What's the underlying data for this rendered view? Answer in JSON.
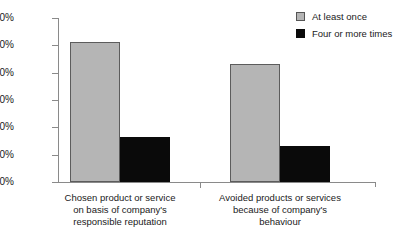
{
  "chart_data": {
    "type": "bar",
    "title": "",
    "xlabel": "",
    "ylabel": "",
    "ylim": [
      0,
      60
    ],
    "grid": false,
    "legend_position": "top-right",
    "categories": [
      "Chosen product or service\non basis of company's\nresponsible reputation",
      "Avoided products or services\nbecause of company's\nbehaviour"
    ],
    "series": [
      {
        "name": "At least once",
        "color": "#b5b5b5",
        "values": [
          51.2,
          43.2
        ]
      },
      {
        "name": "Four or more times",
        "color": "#0a0a0a",
        "values": [
          16.5,
          13.0
        ]
      }
    ],
    "yticks": [
      {
        "value": 60,
        "label": "60%"
      },
      {
        "value": 50,
        "label": "50%"
      },
      {
        "value": 40,
        "label": "40%"
      },
      {
        "value": 30,
        "label": "30%"
      },
      {
        "value": 20,
        "label": "20%"
      },
      {
        "value": 10,
        "label": "10%"
      },
      {
        "value": 0,
        "label": "0%"
      }
    ]
  },
  "legend": {
    "items": [
      {
        "label": "At least once",
        "swatch": "gray"
      },
      {
        "label": "Four or more times",
        "swatch": "black"
      }
    ]
  },
  "axis": {
    "line_color": "#8a8a8a"
  }
}
